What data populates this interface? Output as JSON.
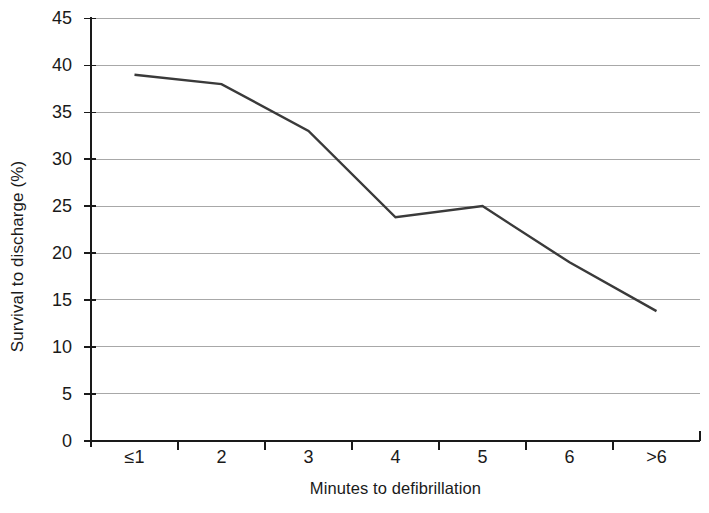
{
  "chart_data": {
    "type": "line",
    "title": "",
    "xlabel": "Minutes to defibrillation",
    "ylabel": "Survival to discharge (%)",
    "categories": [
      "≤1",
      "2",
      "3",
      "4",
      "5",
      "6",
      ">6"
    ],
    "values": [
      39,
      38,
      33,
      23.8,
      25,
      19,
      13.8
    ],
    "series": [
      {
        "name": "Survival to discharge",
        "values": [
          39,
          38,
          33,
          23.8,
          25,
          19,
          13.8
        ]
      }
    ],
    "ylim": [
      0,
      45
    ],
    "yticks": [
      0,
      5,
      10,
      15,
      20,
      25,
      30,
      35,
      40,
      45
    ],
    "ytick_labels": [
      "0",
      "5",
      "10",
      "15",
      "20",
      "25",
      "30",
      "35",
      "40",
      "45"
    ],
    "grid": "horizontal",
    "legend": "none",
    "line_color": "#3a3a3a",
    "grid_color": "#a8a8a8",
    "axis_color": "#1a1a1a",
    "background": "#ffffff"
  },
  "axes": {
    "y_title": "Survival to discharge (%)",
    "x_title": "Minutes to defibrillation",
    "y_labels": [
      "45",
      "40",
      "35",
      "30",
      "25",
      "20",
      "15",
      "10",
      "5",
      "0"
    ],
    "x_labels": [
      "≤1",
      "2",
      "3",
      "4",
      "5",
      "6",
      ">6"
    ]
  }
}
